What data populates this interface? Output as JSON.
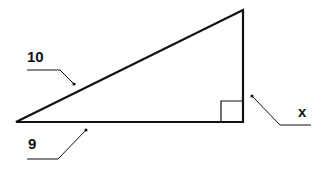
{
  "diagram": {
    "type": "right-triangle",
    "labels": {
      "hypotenuse": "10",
      "base": "9",
      "height": "x"
    },
    "right_angle_marker": true,
    "stroke_color": "#111111",
    "background": "#ffffff"
  }
}
